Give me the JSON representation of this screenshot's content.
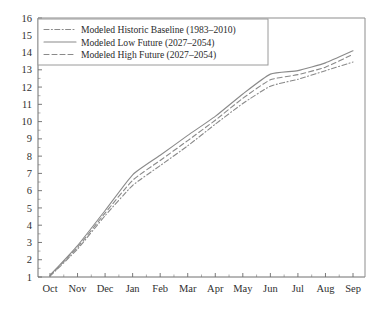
{
  "chart_data": {
    "type": "line",
    "title": "",
    "subtitle": "",
    "xlabel": "",
    "ylabel": "",
    "categories": [
      "Oct",
      "Nov",
      "Dec",
      "Jan",
      "Feb",
      "Mar",
      "Apr",
      "May",
      "Jun",
      "Jul",
      "Aug",
      "Sep"
    ],
    "xtick_labels": [
      "Oct",
      "Nov",
      "Dec",
      "Jan",
      "Feb",
      "Mar",
      "Apr",
      "May",
      "Jun",
      "Jul",
      "Aug",
      "Sep"
    ],
    "ytick_labels": [
      "1",
      "2",
      "3",
      "4",
      "5",
      "6",
      "7",
      "8",
      "9",
      "10",
      "11",
      "12",
      "13",
      "14",
      "15",
      "16"
    ],
    "ylim": [
      1,
      16
    ],
    "ytick_step": 1,
    "grid": false,
    "minor_ticks_x": true,
    "minor_ticks_y": true,
    "legend_position": "top-left inset",
    "series": [
      {
        "name": "Modeled Historic Baseline (1983–2010)",
        "style": "dash-dot-dot",
        "color": "#8a8a8a",
        "values": [
          1.05,
          2.62,
          4.55,
          6.3,
          7.45,
          8.6,
          9.85,
          11.05,
          12.05,
          12.45,
          12.95,
          13.45
        ]
      },
      {
        "name": "Modeled Low Future (2027–2054)",
        "style": "solid",
        "color": "#8a8a8a",
        "values": [
          1.1,
          2.82,
          4.85,
          6.92,
          8.05,
          9.2,
          10.3,
          11.6,
          12.75,
          12.95,
          13.4,
          14.1
        ]
      },
      {
        "name": "Modeled High Future (2027–2054)",
        "style": "dashed",
        "color": "#8a8a8a",
        "values": [
          1.08,
          2.72,
          4.7,
          6.6,
          7.75,
          8.9,
          10.08,
          11.35,
          12.42,
          12.72,
          13.15,
          13.9
        ]
      }
    ],
    "legend": [
      "Modeled Historic Baseline (1983–2010)",
      "Modeled Low Future (2027–2054)",
      "Modeled High Future (2027–2054)"
    ]
  }
}
